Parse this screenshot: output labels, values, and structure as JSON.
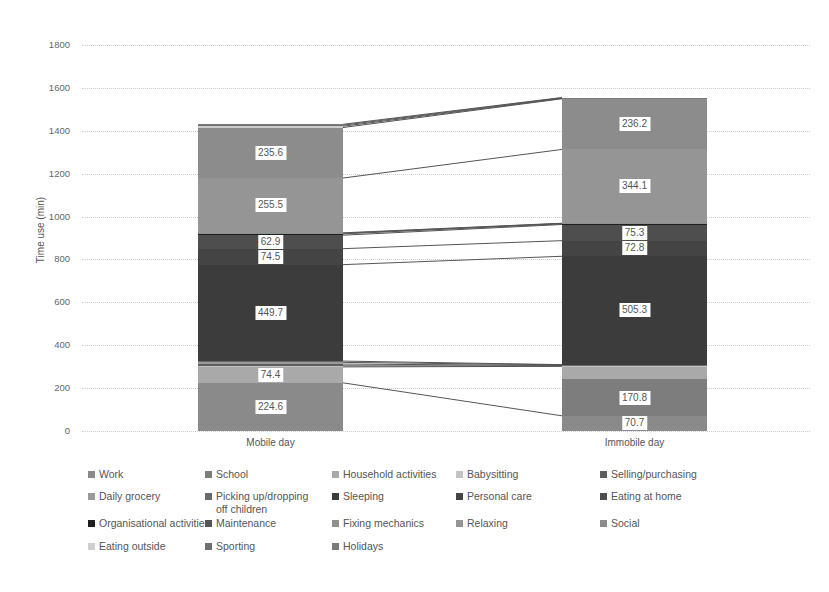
{
  "chart_data": {
    "type": "bar",
    "subtype": "stacked",
    "title": "",
    "xlabel": "",
    "ylabel": "Time use (min)",
    "ylim": [
      0,
      1800
    ],
    "yticks": [
      0,
      200,
      400,
      600,
      800,
      1000,
      1200,
      1400,
      1600,
      1800
    ],
    "grid": true,
    "legend_position": "bottom",
    "categories": [
      "Mobile day",
      "Immobile day"
    ],
    "series": [
      {
        "name": "Work",
        "color": "#8a8a8a",
        "values": [
          224.6,
          70.7
        ]
      },
      {
        "name": "School",
        "color": "#7d7d7d",
        "values": [
          0,
          170.8
        ]
      },
      {
        "name": "Household activities",
        "color": "#a9a9a9",
        "values": [
          74.4,
          60
        ]
      },
      {
        "name": "Babysitting",
        "color": "#c4c4c4",
        "values": [
          5,
          2
        ]
      },
      {
        "name": "Selling/purchasing",
        "color": "#5e5e5e",
        "values": [
          8,
          2
        ]
      },
      {
        "name": "Daily grocery",
        "color": "#9a9a9a",
        "values": [
          8,
          3
        ]
      },
      {
        "name": "Picking up/dropping off children",
        "color": "#6a6a6a",
        "values": [
          6,
          1
        ]
      },
      {
        "name": "Sleeping",
        "color": "#3c3c3c",
        "values": [
          449.7,
          505.3
        ]
      },
      {
        "name": "Personal care",
        "color": "#444444",
        "values": [
          74.5,
          72.8
        ]
      },
      {
        "name": "Eating at home",
        "color": "#4e4e4e",
        "values": [
          62.9,
          75.3
        ]
      },
      {
        "name": "Organisational activities",
        "color": "#1f1f1f",
        "values": [
          6,
          3
        ]
      },
      {
        "name": "Maintenance",
        "color": "#555555",
        "values": [
          3,
          2
        ]
      },
      {
        "name": "Fixing mechanics",
        "color": "#8f8f8f",
        "values": [
          2,
          1
        ]
      },
      {
        "name": "Relaxing",
        "color": "#959595",
        "values": [
          255.5,
          344.1
        ]
      },
      {
        "name": "Social",
        "color": "#8c8c8c",
        "values": [
          235.6,
          236.2
        ]
      },
      {
        "name": "Eating outside",
        "color": "#cfcfcf",
        "values": [
          6,
          2
        ]
      },
      {
        "name": "Sporting",
        "color": "#6f6f6f",
        "values": [
          5,
          2
        ]
      },
      {
        "name": "Holidays",
        "color": "#7a7a7a",
        "values": [
          4,
          2
        ]
      }
    ],
    "data_labels": {
      "Mobile day": [
        "224.6",
        "74.4",
        "449.7",
        "74.5",
        "62.9",
        "255.5",
        "235.6"
      ],
      "Immobile day": [
        "70.7",
        "170.8",
        "505.3",
        "72.8",
        "75.3",
        "344.1",
        "236.2"
      ]
    }
  },
  "axis": {
    "ylabel": "Time use (min)",
    "ticks": [
      "0",
      "200",
      "400",
      "600",
      "800",
      "1000",
      "1200",
      "1400",
      "1600",
      "1800"
    ]
  },
  "bars": {
    "mobile": {
      "label": "Mobile day",
      "segments": [
        {
          "name": "Work",
          "value": 224.6,
          "label": "224.6",
          "color": "#8a8a8a"
        },
        {
          "name": "Household activities",
          "value": 74.4,
          "label": "74.4",
          "color": "#a9a9a9"
        },
        {
          "name": "Babysitting",
          "value": 5,
          "label": "",
          "color": "#c4c4c4"
        },
        {
          "name": "Selling/purchasing",
          "value": 8,
          "label": "",
          "color": "#5e5e5e"
        },
        {
          "name": "Daily grocery",
          "value": 8,
          "label": "",
          "color": "#9a9a9a"
        },
        {
          "name": "Picking up/dropping off children",
          "value": 6,
          "label": "",
          "color": "#6a6a6a"
        },
        {
          "name": "Sleeping",
          "value": 449.7,
          "label": "449.7",
          "color": "#3c3c3c"
        },
        {
          "name": "Personal care",
          "value": 74.5,
          "label": "74.5",
          "color": "#444444"
        },
        {
          "name": "Eating at home",
          "value": 62.9,
          "label": "62.9",
          "color": "#4e4e4e"
        },
        {
          "name": "Organisational activities",
          "value": 6,
          "label": "",
          "color": "#1f1f1f"
        },
        {
          "name": "Maintenance",
          "value": 3,
          "label": "",
          "color": "#555555"
        },
        {
          "name": "Fixing mechanics",
          "value": 2,
          "label": "",
          "color": "#8f8f8f"
        },
        {
          "name": "Relaxing",
          "value": 255.5,
          "label": "255.5",
          "color": "#959595"
        },
        {
          "name": "Social",
          "value": 235.6,
          "label": "235.6",
          "color": "#8c8c8c"
        },
        {
          "name": "Eating outside",
          "value": 6,
          "label": "",
          "color": "#cfcfcf"
        },
        {
          "name": "Sporting",
          "value": 5,
          "label": "",
          "color": "#6f6f6f"
        },
        {
          "name": "Holidays",
          "value": 4,
          "label": "",
          "color": "#7a7a7a"
        }
      ]
    },
    "immobile": {
      "label": "Immobile day",
      "segments": [
        {
          "name": "Work",
          "value": 70.7,
          "label": "70.7",
          "color": "#8a8a8a"
        },
        {
          "name": "School",
          "value": 170.8,
          "label": "170.8",
          "color": "#7d7d7d"
        },
        {
          "name": "Household activities",
          "value": 60,
          "label": "",
          "color": "#a9a9a9"
        },
        {
          "name": "Babysitting",
          "value": 2,
          "label": "",
          "color": "#c4c4c4"
        },
        {
          "name": "Selling/purchasing",
          "value": 2,
          "label": "",
          "color": "#5e5e5e"
        },
        {
          "name": "Daily grocery",
          "value": 3,
          "label": "",
          "color": "#9a9a9a"
        },
        {
          "name": "Picking up/dropping off children",
          "value": 1,
          "label": "",
          "color": "#6a6a6a"
        },
        {
          "name": "Sleeping",
          "value": 505.3,
          "label": "505.3",
          "color": "#3c3c3c"
        },
        {
          "name": "Personal care",
          "value": 72.8,
          "label": "72.8",
          "color": "#444444"
        },
        {
          "name": "Eating at home",
          "value": 75.3,
          "label": "75.3",
          "color": "#4e4e4e"
        },
        {
          "name": "Organisational activities",
          "value": 3,
          "label": "",
          "color": "#1f1f1f"
        },
        {
          "name": "Maintenance",
          "value": 2,
          "label": "",
          "color": "#555555"
        },
        {
          "name": "Fixing mechanics",
          "value": 1,
          "label": "",
          "color": "#8f8f8f"
        },
        {
          "name": "Relaxing",
          "value": 344.1,
          "label": "344.1",
          "color": "#959595"
        },
        {
          "name": "Social",
          "value": 236.2,
          "label": "236.2",
          "color": "#8c8c8c"
        },
        {
          "name": "Eating outside",
          "value": 2,
          "label": "",
          "color": "#cfcfcf"
        },
        {
          "name": "Sporting",
          "value": 2,
          "label": "",
          "color": "#6f6f6f"
        },
        {
          "name": "Holidays",
          "value": 2,
          "label": "",
          "color": "#7a7a7a"
        }
      ]
    }
  },
  "legend": {
    "items": [
      {
        "label": "Work",
        "color": "#8a8a8a"
      },
      {
        "label": "School",
        "color": "#7d7d7d"
      },
      {
        "label": "Household activities",
        "color": "#a9a9a9"
      },
      {
        "label": "Babysitting",
        "color": "#c4c4c4"
      },
      {
        "label": "Selling/purchasing",
        "color": "#5e5e5e"
      },
      {
        "label": "Daily grocery",
        "color": "#9a9a9a"
      },
      {
        "label": "Picking up/dropping off children",
        "color": "#6a6a6a"
      },
      {
        "label": "Sleeping",
        "color": "#3c3c3c"
      },
      {
        "label": "Personal care",
        "color": "#444444"
      },
      {
        "label": "Eating at home",
        "color": "#4e4e4e"
      },
      {
        "label": "Organisational activities",
        "color": "#1f1f1f"
      },
      {
        "label": "Maintenance",
        "color": "#555555"
      },
      {
        "label": "Fixing mechanics",
        "color": "#8f8f8f"
      },
      {
        "label": "Relaxing",
        "color": "#959595"
      },
      {
        "label": "Social",
        "color": "#8c8c8c"
      },
      {
        "label": "Eating outside",
        "color": "#cfcfcf"
      },
      {
        "label": "Sporting",
        "color": "#6f6f6f"
      },
      {
        "label": "Holidays",
        "color": "#7a7a7a"
      }
    ]
  }
}
